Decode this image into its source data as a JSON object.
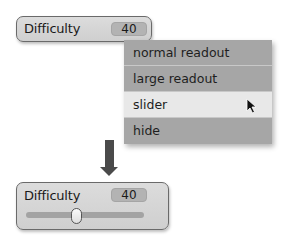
{
  "top_monitor": {
    "label": "Difficulty",
    "value": "40"
  },
  "context_menu": {
    "items": [
      {
        "label": "normal readout",
        "highlighted": false
      },
      {
        "label": "large readout",
        "highlighted": false
      },
      {
        "label": "slider",
        "highlighted": true
      },
      {
        "label": "hide",
        "highlighted": false
      }
    ]
  },
  "transition_arrow": {
    "direction": "down",
    "color": "#4a4a4a"
  },
  "bottom_monitor": {
    "label": "Difficulty",
    "value": "40",
    "slider_position_fraction": 0.4
  }
}
